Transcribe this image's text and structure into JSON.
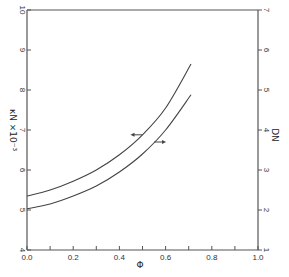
{
  "chart_data": {
    "type": "line",
    "title": "",
    "xlabel": "Φ",
    "ylabel_left": "κN ×10⁻³",
    "ylabel_right": "DN",
    "xlim": [
      0.0,
      1.0
    ],
    "ylim_left": [
      4,
      10
    ],
    "ylim_right": [
      1,
      7
    ],
    "x_ticks": [
      "0.0",
      "0.2",
      "0.4",
      "0.6",
      "0.8",
      "1.0"
    ],
    "y_ticks_left": [
      "4",
      "5",
      "6",
      "7",
      "8",
      "9",
      "10"
    ],
    "y_ticks_right": [
      "1",
      "2",
      "3",
      "4",
      "5",
      "6",
      "7"
    ],
    "grid": false,
    "legend": "arrows on curves indicate axis (left arrow → left axis κN, right arrow → right axis DN)",
    "series": [
      {
        "name": "κN ×10⁻³",
        "axis": "left",
        "x": [
          0.0,
          0.1,
          0.2,
          0.3,
          0.4,
          0.5,
          0.6,
          0.71
        ],
        "values": [
          5.35,
          5.5,
          5.72,
          6.0,
          6.38,
          6.88,
          7.55,
          8.65
        ]
      },
      {
        "name": "DN",
        "axis": "right",
        "x": [
          0.0,
          0.1,
          0.2,
          0.3,
          0.4,
          0.5,
          0.6,
          0.71
        ],
        "values": [
          2.03,
          2.15,
          2.35,
          2.6,
          2.95,
          3.4,
          4.0,
          4.88
        ]
      }
    ],
    "annotations": [
      {
        "type": "arrow",
        "direction": "left",
        "series": "κN ×10⁻³",
        "at_x": 0.5
      },
      {
        "type": "arrow",
        "direction": "right",
        "series": "DN",
        "at_x": 0.55
      }
    ]
  }
}
